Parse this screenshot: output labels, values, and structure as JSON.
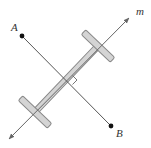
{
  "diagram": {
    "line_m": {
      "label": "m",
      "from": [
        9,
        139
      ],
      "to": [
        129,
        18
      ],
      "color": "#666666"
    },
    "segment_AB": {
      "color": "#555555",
      "point_A": {
        "label": "A",
        "x": 22,
        "y": 36
      },
      "point_B": {
        "label": "B",
        "x": 111,
        "y": 126
      }
    },
    "right_angle_marker": {
      "at": [
        68,
        80
      ]
    },
    "t_square": {
      "fill": "#d4d4d4",
      "stroke": "#888888",
      "shaft": {
        "from": [
          35,
          112
        ],
        "to": [
          98,
          46
        ]
      },
      "upper_crossbar": {
        "center": [
          98,
          46
        ]
      },
      "lower_crossbar": {
        "center": [
          35,
          112
        ]
      }
    },
    "labels": {
      "A": "A",
      "B": "B",
      "m": "m"
    }
  }
}
